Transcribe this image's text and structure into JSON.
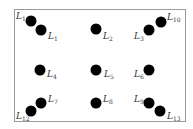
{
  "diagram": {
    "frame": {
      "left": 14,
      "top": 9,
      "width": 172,
      "height": 113,
      "border_color": "#9a9a9a"
    },
    "dot_color": "#000000",
    "points": [
      {
        "id": "L1",
        "prefix": "L",
        "sub": "1",
        "x": 41,
        "y": 30,
        "lx": 48,
        "ly": 32
      },
      {
        "id": "L2",
        "prefix": "L",
        "sub": "2",
        "x": 96,
        "y": 29,
        "lx": 103,
        "ly": 32
      },
      {
        "id": "L3",
        "prefix": "L",
        "sub": "3",
        "x": 149,
        "y": 30,
        "lx": 134,
        "ly": 32
      },
      {
        "id": "L4",
        "prefix": "L",
        "sub": "4",
        "x": 40,
        "y": 70,
        "lx": 47,
        "ly": 70
      },
      {
        "id": "L5",
        "prefix": "L",
        "sub": "5",
        "x": 96,
        "y": 70,
        "lx": 104,
        "ly": 70
      },
      {
        "id": "L6",
        "prefix": "L",
        "sub": "6",
        "x": 149,
        "y": 70,
        "lx": 134,
        "ly": 70
      },
      {
        "id": "L7",
        "prefix": "L",
        "sub": "7",
        "x": 41,
        "y": 103,
        "lx": 48,
        "ly": 95
      },
      {
        "id": "L8",
        "prefix": "L",
        "sub": "8",
        "x": 96,
        "y": 103,
        "lx": 103,
        "ly": 95
      },
      {
        "id": "L9",
        "prefix": "L",
        "sub": "9",
        "x": 149,
        "y": 103,
        "lx": 134,
        "ly": 95
      },
      {
        "id": "L10",
        "prefix": "L",
        "sub": "10",
        "x": 161,
        "y": 22,
        "lx": 167,
        "ly": 13
      },
      {
        "id": "L11",
        "prefix": "L",
        "sub": "11",
        "x": 31,
        "y": 21,
        "lx": 16,
        "ly": 12
      },
      {
        "id": "L12",
        "prefix": "L",
        "sub": "12",
        "x": 31,
        "y": 111,
        "lx": 16,
        "ly": 112
      },
      {
        "id": "L13",
        "prefix": "L",
        "sub": "13",
        "x": 160,
        "y": 111,
        "lx": 167,
        "ly": 112
      }
    ]
  }
}
